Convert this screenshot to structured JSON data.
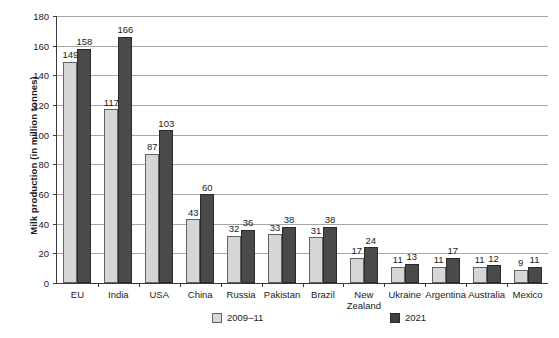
{
  "chart_data": {
    "type": "bar",
    "title": "",
    "xlabel": "",
    "ylabel": "Milk production (in million tonnes)",
    "ylim": [
      0,
      180
    ],
    "yticks": [
      0,
      20,
      40,
      60,
      80,
      100,
      120,
      140,
      160,
      180
    ],
    "grid": true,
    "legend_position": "bottom",
    "categories": [
      "EU",
      "India",
      "USA",
      "China",
      "Russia",
      "Pakistan",
      "Brazil",
      "New Zealand",
      "Ukraine",
      "Argentina",
      "Australia",
      "Mexico"
    ],
    "series": [
      {
        "name": "2009–11",
        "color": "#d6d6d6",
        "values": [
          149,
          117,
          87,
          43,
          32,
          33,
          31,
          17,
          11,
          11,
          11,
          9
        ]
      },
      {
        "name": "2021",
        "color": "#4a4a4a",
        "values": [
          158,
          166,
          103,
          60,
          36,
          38,
          38,
          24,
          13,
          17,
          12,
          11
        ]
      }
    ]
  },
  "legend": {
    "items": [
      {
        "label": "2009–11",
        "swatch": "light"
      },
      {
        "label": "2021",
        "swatch": "dark"
      }
    ]
  }
}
